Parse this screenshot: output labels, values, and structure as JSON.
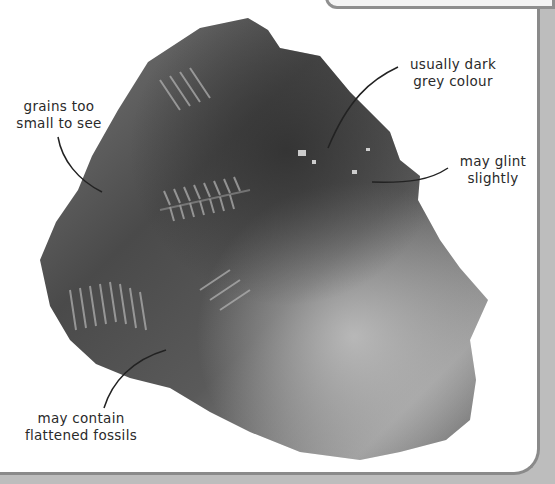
{
  "figure": {
    "colors": {
      "panel": "#ffffff",
      "border": "#8a8a8a",
      "rock_dark": "#3c3c3c",
      "rock_light": "#9a9a9a",
      "text": "#2a2a2a"
    }
  },
  "annotations": [
    {
      "id": "grains",
      "line1": "grains too",
      "line2": "small to see"
    },
    {
      "id": "colour",
      "line1": "usually dark",
      "line2": "grey colour"
    },
    {
      "id": "glint",
      "line1": "may glint",
      "line2": "slightly"
    },
    {
      "id": "fossils",
      "line1": "may contain",
      "line2": "flattened fossils"
    }
  ]
}
